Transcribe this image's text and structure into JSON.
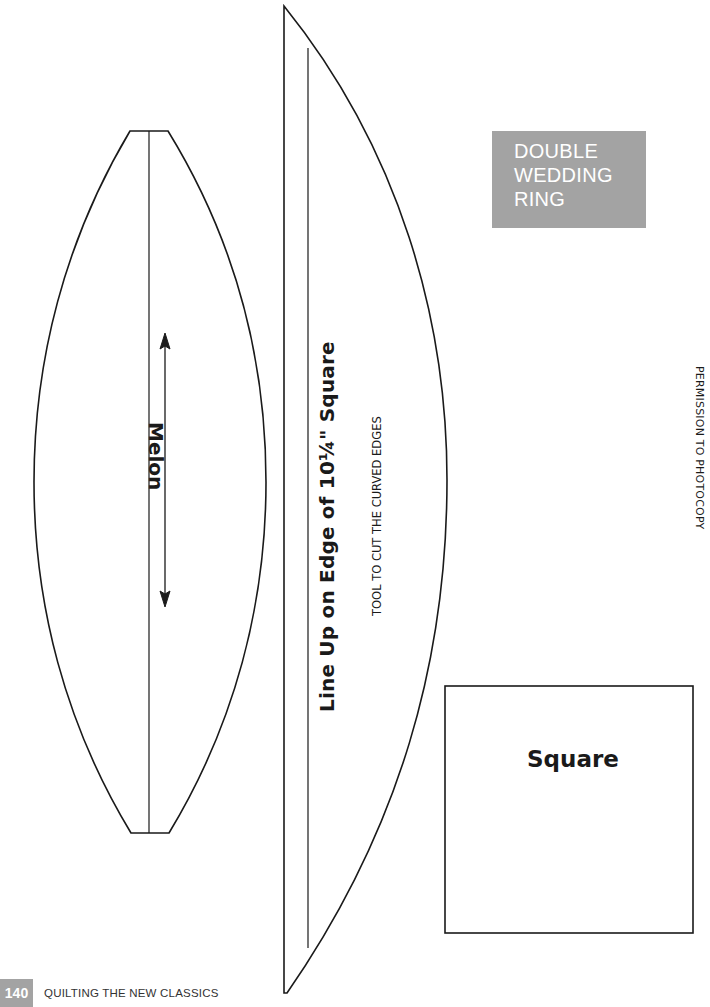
{
  "header": {
    "title_lines": [
      "DOUBLE",
      "WEDDING",
      "RING"
    ],
    "title_box_color": "#a3a3a3"
  },
  "templates": {
    "melon": {
      "label": "Melon",
      "grainline_icon": "double-arrow-icon"
    },
    "cutting_tool": {
      "label": "Line Up on Edge of 10¼\" Square",
      "sublabel": "TOOL TO CUT THE CURVED EDGES"
    },
    "square": {
      "label": "Square"
    }
  },
  "side_note": "PERMISSION TO PHOTOCOPY",
  "footer": {
    "page_number": "140",
    "book_title": "QUILTING THE NEW CLASSICS"
  }
}
